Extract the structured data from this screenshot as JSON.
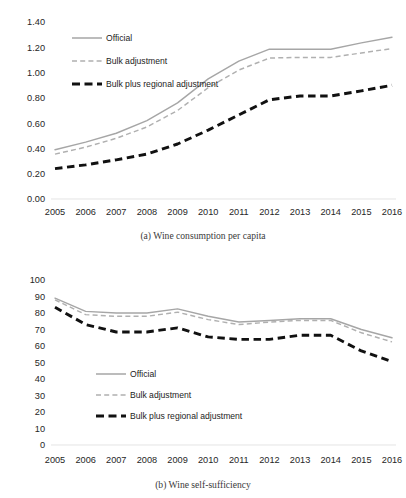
{
  "figure": {
    "background": "#ffffff",
    "colors": {
      "official": "#a6a6a6",
      "bulk": "#b0b0b0",
      "bulk_plus_regional": "#111111",
      "text": "#262626",
      "caption": "#3a3a3a"
    }
  },
  "panel_a": {
    "caption": "(a)  Wine consumption per capita",
    "caption_index": "(a)",
    "caption_text": "Wine consumption per capita",
    "legend": {
      "position": "upper-left",
      "items": [
        {
          "label": "Official",
          "style": "solid",
          "color": "#a6a6a6"
        },
        {
          "label": "Bulk adjustment",
          "style": "dashed",
          "color": "#b0b0b0"
        },
        {
          "label": "Bulk plus regional adjustment",
          "style": "thick-dashed",
          "color": "#111111"
        }
      ]
    },
    "ytick_labels": [
      "0.00",
      "0.20",
      "0.40",
      "0.60",
      "0.80",
      "1.00",
      "1.20",
      "1.40"
    ],
    "xtick_labels": [
      "2005",
      "2006",
      "2007",
      "2008",
      "2009",
      "2010",
      "2011",
      "2012",
      "2013",
      "2014",
      "2015",
      "2016"
    ]
  },
  "panel_b": {
    "caption": "(b)  Wine self-sufficiency",
    "caption_index": "(b)",
    "caption_text": "Wine self-sufficiency",
    "legend": {
      "position": "lower-center-left",
      "items": [
        {
          "label": "Official",
          "style": "solid",
          "color": "#a6a6a6"
        },
        {
          "label": "Bulk adjustment",
          "style": "dashed",
          "color": "#b0b0b0"
        },
        {
          "label": "Bulk plus regional adjustment",
          "style": "thick-dashed",
          "color": "#111111"
        }
      ]
    },
    "ytick_labels": [
      "0",
      "10",
      "20",
      "30",
      "40",
      "50",
      "60",
      "70",
      "80",
      "90",
      "100"
    ],
    "xtick_labels": [
      "2005",
      "2006",
      "2007",
      "2008",
      "2009",
      "2010",
      "2011",
      "2012",
      "2013",
      "2014",
      "2015",
      "2016"
    ]
  },
  "chart_data": [
    {
      "type": "line",
      "panel": "a",
      "title": "(a)  Wine consumption per capita",
      "xlabel": "",
      "ylabel": "",
      "x": [
        2005,
        2006,
        2007,
        2008,
        2009,
        2010,
        2011,
        2012,
        2013,
        2014,
        2015,
        2016
      ],
      "categories": [
        "2005",
        "2006",
        "2007",
        "2008",
        "2009",
        "2010",
        "2011",
        "2012",
        "2013",
        "2014",
        "2015",
        "2016"
      ],
      "xlim": [
        2005,
        2016
      ],
      "ylim": [
        0.0,
        1.4
      ],
      "ytick_step": 0.2,
      "grid": false,
      "legend_position": "upper-left",
      "series": [
        {
          "name": "Official",
          "color": "#a6a6a6",
          "style": "solid",
          "values": [
            0.39,
            0.45,
            0.52,
            0.62,
            0.76,
            0.95,
            1.09,
            1.185,
            1.185,
            1.185,
            1.235,
            1.28
          ]
        },
        {
          "name": "Bulk adjustment",
          "color": "#b0b0b0",
          "style": "dashed",
          "values": [
            0.355,
            0.41,
            0.48,
            0.57,
            0.7,
            0.88,
            1.02,
            1.115,
            1.12,
            1.12,
            1.155,
            1.19
          ]
        },
        {
          "name": "Bulk plus regional adjustment",
          "color": "#111111",
          "style": "thick-dashed",
          "values": [
            0.24,
            0.27,
            0.31,
            0.355,
            0.435,
            0.545,
            0.665,
            0.785,
            0.815,
            0.815,
            0.855,
            0.9
          ]
        }
      ]
    },
    {
      "type": "line",
      "panel": "b",
      "title": "(b)  Wine self-sufficiency",
      "xlabel": "",
      "ylabel": "",
      "x": [
        2005,
        2006,
        2007,
        2008,
        2009,
        2010,
        2011,
        2012,
        2013,
        2014,
        2015,
        2016
      ],
      "categories": [
        "2005",
        "2006",
        "2007",
        "2008",
        "2009",
        "2010",
        "2011",
        "2012",
        "2013",
        "2014",
        "2015",
        "2016"
      ],
      "xlim": [
        2005,
        2016
      ],
      "ylim": [
        0,
        100
      ],
      "ytick_step": 10,
      "grid": false,
      "legend_position": "lower-center-left",
      "series": [
        {
          "name": "Official",
          "color": "#a6a6a6",
          "style": "solid",
          "values": [
            89,
            81,
            80,
            80,
            82.5,
            78,
            74.5,
            75.5,
            76.5,
            76.5,
            70,
            65
          ]
        },
        {
          "name": "Bulk adjustment",
          "color": "#b0b0b0",
          "style": "dashed",
          "values": [
            88,
            79,
            78,
            78,
            80.5,
            76,
            73,
            74.5,
            75.5,
            75.5,
            68,
            62.5
          ]
        },
        {
          "name": "Bulk plus regional adjustment",
          "color": "#111111",
          "style": "thick-dashed",
          "values": [
            83.5,
            73,
            68.5,
            68.5,
            71,
            65.5,
            64,
            64,
            66.5,
            66.5,
            57,
            50.5
          ]
        }
      ]
    }
  ]
}
